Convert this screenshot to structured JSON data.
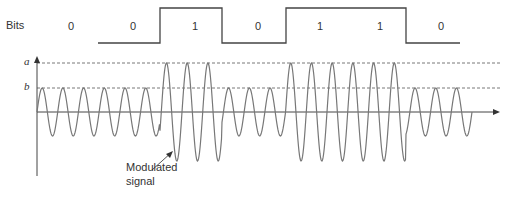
{
  "title_label": "Bits",
  "bits": [
    "0",
    "0",
    "1",
    "0",
    "1",
    "1",
    "0"
  ],
  "levels": {
    "a_label": "a",
    "b_label": "b"
  },
  "annotation": {
    "line1": "Modulated",
    "line2": "signal"
  },
  "colors": {
    "line": "#444444",
    "wave": "#777777",
    "dash": "#555555",
    "text": "#333333"
  },
  "chart_data": {
    "type": "line",
    "bit_sequence": [
      0,
      0,
      1,
      0,
      1,
      1,
      0
    ],
    "cycles_per_bit": 3,
    "amplitude_levels": {
      "a": "high amplitude (bit 1)",
      "b": "low amplitude (bit 0)"
    },
    "amplitude_ratio_a_over_b": 2,
    "xlabel": "time",
    "ylabel": "amplitude",
    "annotations": [
      "Modulated signal"
    ]
  },
  "geometry": {
    "x0": 37,
    "bit_width": 62,
    "zero_y": 112,
    "a_y": 63,
    "b_y": 88,
    "bits_high_y": 8,
    "bits_low_y": 43,
    "axis_end_x": 500
  }
}
